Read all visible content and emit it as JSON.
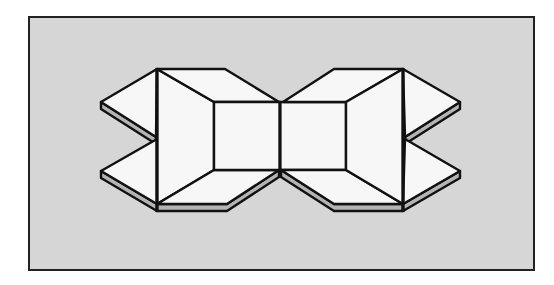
{
  "figure": {
    "colors": {
      "page": "#ffffff",
      "panel": "#d6d6d6",
      "face": "#f7f7f7",
      "edge_shade": "#b4b4b4",
      "stroke": "#111111"
    },
    "panel": {
      "x": 29,
      "y": 17,
      "width": 505,
      "height": 253
    }
  }
}
